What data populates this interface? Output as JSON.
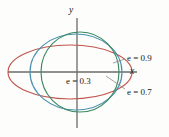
{
  "figure": {
    "background": "#fdfdfc",
    "axis_color": "#6b6b6b",
    "axes": {
      "x_label": "x",
      "y_label": "y",
      "origin": [
        77,
        72
      ]
    },
    "labels": {
      "e09": "e = 0.9",
      "e07": "e = 0.7",
      "e03": "e = 0.3"
    }
  },
  "chart_data": {
    "type": "line",
    "title": "",
    "xlabel": "x",
    "ylabel": "y",
    "grid": false,
    "legend": "inline-annotations",
    "annotations": [
      {
        "text": "e = 0.9",
        "color": "#c0564e",
        "x": 127,
        "y": 54
      },
      {
        "text": "e = 0.7",
        "color": "#4a90b0",
        "x": 127,
        "y": 88
      },
      {
        "text": "e = 0.3",
        "color": "#3d8a5f",
        "x": 66,
        "y": 77
      },
      {
        "text": "x",
        "x": 130,
        "y": 67
      },
      {
        "text": "y",
        "x": 69,
        "y": 6
      }
    ],
    "series": [
      {
        "name": "e = 0.9",
        "eccentricity": 0.9,
        "color": "#c0564e",
        "center_px": [
          70,
          72
        ],
        "semi_major_px": 62,
        "semi_minor_px": 27,
        "orientation": "horizontal"
      },
      {
        "name": "e = 0.7",
        "eccentricity": 0.7,
        "color": "#4a90b0",
        "center_px": [
          76,
          72
        ],
        "semi_major_px": 46,
        "semi_minor_px": 38,
        "orientation": "horizontal"
      },
      {
        "name": "e = 0.3",
        "eccentricity": 0.3,
        "color": "#3d8a5f",
        "center_px": [
          80,
          72
        ],
        "semi_major_px": 39,
        "semi_minor_px": 40,
        "orientation": "horizontal"
      }
    ],
    "leaders": [
      {
        "from": [
          126,
          59
        ],
        "to": [
          112,
          63
        ],
        "for": "e = 0.9"
      },
      {
        "from": [
          126,
          90
        ],
        "to": [
          108,
          79
        ],
        "for": "e = 0.7"
      }
    ]
  }
}
